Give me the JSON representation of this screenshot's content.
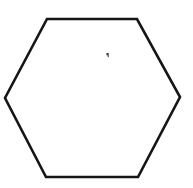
{
  "canvas": {
    "width": 193,
    "height": 188,
    "background_color": "#ffffff"
  },
  "figure": {
    "title": "Hexagon",
    "shape_name": "hexagon",
    "sides": 6,
    "orientation": "flat-top",
    "fill_color": "#ffffff",
    "stroke_color": "#151515",
    "stroke_width": 2.6,
    "vertices": [
      {
        "label": "top-left",
        "x": 47,
        "y": 19
      },
      {
        "label": "top-right",
        "x": 137,
        "y": 19
      },
      {
        "label": "right",
        "x": 180,
        "y": 97
      },
      {
        "label": "bottom-right",
        "x": 138,
        "y": 177
      },
      {
        "label": "bottom-left",
        "x": 46,
        "y": 177
      },
      {
        "label": "left",
        "x": 5,
        "y": 98
      }
    ],
    "points_attr": "47,19 137,19 180,97 138,177 46,177 5,98"
  },
  "artifacts": [
    {
      "name": "speck",
      "description": "small dark speck inside the hexagon",
      "x": 107,
      "y": 54,
      "width": 3,
      "height": 4,
      "color": "#3a3a3a"
    }
  ],
  "accessibility": {
    "figure_alt": "Black outline of a regular hexagon with flat top and bottom edges on a white background, with a tiny dark speck in the upper middle area."
  }
}
